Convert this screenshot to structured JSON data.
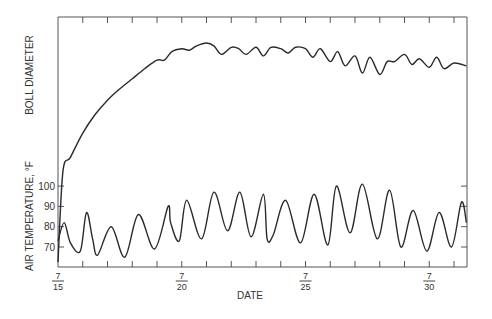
{
  "chart_data": {
    "type": "line",
    "title": "",
    "xlabel": "DATE",
    "ylabels": [
      "BOLL DIAMETER",
      "AIR TEMPERATURE, °F"
    ],
    "x_ticks": [
      {
        "num": "7",
        "den": "15",
        "day": 15
      },
      {
        "num": "7",
        "den": "20",
        "day": 20
      },
      {
        "num": "7",
        "den": "25",
        "day": 25
      },
      {
        "num": "7",
        "den": "30",
        "day": 30
      }
    ],
    "x_range_days": [
      15,
      31.5
    ],
    "y_ticks_temperature": [
      70,
      80,
      90,
      100
    ],
    "grid": false,
    "series": [
      {
        "name": "Boll diameter (relative, unitless)",
        "x_day": [
          15.0,
          15.2,
          15.5,
          16.0,
          16.5,
          17.0,
          17.5,
          18.0,
          18.5,
          19.0,
          19.3,
          19.6,
          20.0,
          20.3,
          20.6,
          21.0,
          21.3,
          21.6,
          22.0,
          22.3,
          22.6,
          23.0,
          23.3,
          23.6,
          24.0,
          24.3,
          24.6,
          25.0,
          25.3,
          25.6,
          26.0,
          26.3,
          26.6,
          27.0,
          27.3,
          27.6,
          28.0,
          28.3,
          28.6,
          29.0,
          29.3,
          29.6,
          30.0,
          30.3,
          30.6,
          31.0,
          31.5
        ],
        "values": [
          0.0,
          0.1,
          0.2,
          0.37,
          0.5,
          0.6,
          0.68,
          0.75,
          0.82,
          0.88,
          0.88,
          0.94,
          0.96,
          0.95,
          0.98,
          1.0,
          0.98,
          0.92,
          0.97,
          0.96,
          0.92,
          0.97,
          0.91,
          0.97,
          0.96,
          0.93,
          0.97,
          0.96,
          0.9,
          0.96,
          0.87,
          0.94,
          0.84,
          0.91,
          0.79,
          0.9,
          0.78,
          0.87,
          0.87,
          0.92,
          0.85,
          0.89,
          0.83,
          0.9,
          0.82,
          0.86,
          0.84
        ]
      },
      {
        "name": "Air temperature (°F)",
        "x_day": [
          15.0,
          15.25,
          15.5,
          15.9,
          16.15,
          16.4,
          16.6,
          17.15,
          17.7,
          18.25,
          18.9,
          19.45,
          19.55,
          19.9,
          20.2,
          20.8,
          21.3,
          21.85,
          22.35,
          22.8,
          23.3,
          23.45,
          23.7,
          24.2,
          24.8,
          25.35,
          25.9,
          26.25,
          26.8,
          27.3,
          27.9,
          28.4,
          28.85,
          29.35,
          29.9,
          30.4,
          30.9,
          31.3,
          31.5
        ],
        "values": [
          73,
          82,
          72,
          68,
          87,
          74,
          66,
          80,
          65,
          86,
          69,
          90,
          82,
          73,
          93,
          74,
          97,
          78,
          97,
          75,
          96,
          74,
          76,
          93,
          72,
          96,
          71,
          100,
          77,
          101,
          74,
          98,
          70,
          88,
          68,
          87,
          70,
          92,
          82
        ]
      }
    ]
  },
  "axes": {
    "x_label": "DATE",
    "y_label_top": "BOLL DIAMETER",
    "y_label_bottom": "AIR TEMPERATURE, °F",
    "y_tick_labels": [
      "100",
      "90",
      "80",
      "70"
    ],
    "x_tick_labels": [
      {
        "num": "7",
        "den": "15"
      },
      {
        "num": "7",
        "den": "20"
      },
      {
        "num": "7",
        "den": "25"
      },
      {
        "num": "7",
        "den": "30"
      }
    ]
  },
  "colors": {
    "line": "#2a2a2a",
    "axis": "#555555",
    "background": "#ffffff"
  }
}
